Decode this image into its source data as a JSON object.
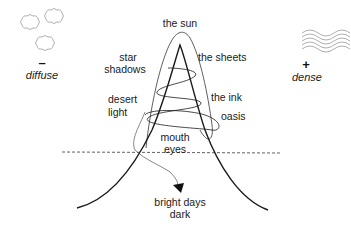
{
  "diagram": {
    "title_top": "the sun",
    "left_labels": {
      "star_shadows_line1": "star",
      "star_shadows_line2": "shadows",
      "desert_light_line1": "desert",
      "desert_light_line2": "light"
    },
    "right_labels": {
      "the_sheets": "the sheets",
      "the_ink": "the ink",
      "oasis": "oasis"
    },
    "center_labels": {
      "mouth": "mouth",
      "eyes": "eyes"
    },
    "bottom_labels": {
      "bright_days": "bright days",
      "dark": "dark"
    },
    "left_pole": {
      "sign": "–",
      "label": "diffuse",
      "icon": "clouds-icon"
    },
    "right_pole": {
      "sign": "+",
      "label": "dense",
      "icon": "waves-icon"
    },
    "colors": {
      "stroke": "#1a1a1a",
      "light_stroke": "#8a8a8a",
      "text": "#1a1a1a"
    }
  }
}
